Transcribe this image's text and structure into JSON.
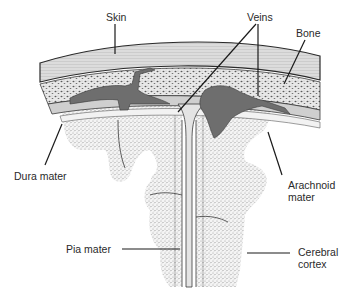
{
  "diagram": {
    "type": "anatomical-cross-section",
    "colors": {
      "background": "#ffffff",
      "line": "#2a2a2a",
      "skin": "#d9d9d9",
      "bone": "#e6e6e6",
      "veins": "#6e6e6e",
      "dura": "#c8c8c8",
      "arachnoid": "#f2f2f2",
      "cortex_stipple": "#bdbdbd"
    },
    "labels": {
      "skin": "Skin",
      "veins": "Veins",
      "bone": "Bone",
      "dura_mater": "Dura mater",
      "arachnoid_mater": "Arachnoid\nmater",
      "pia_mater": "Pia mater",
      "cerebral_cortex": "Cerebral\ncortex"
    },
    "label_positions": {
      "skin": {
        "x": 106,
        "y": 11
      },
      "veins": {
        "x": 247,
        "y": 11
      },
      "bone": {
        "x": 296,
        "y": 27
      },
      "dura_mater": {
        "x": 14,
        "y": 170
      },
      "arachnoid_mater": {
        "x": 288,
        "y": 179
      },
      "pia_mater": {
        "x": 66,
        "y": 243
      },
      "cerebral_cortex": {
        "x": 298,
        "y": 246
      }
    }
  }
}
